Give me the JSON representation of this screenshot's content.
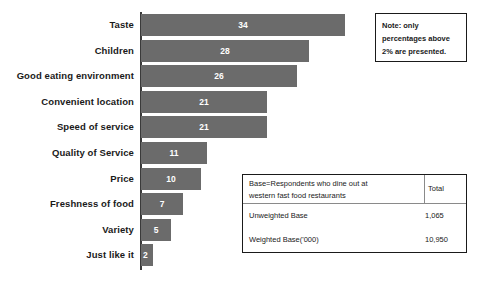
{
  "chart_data": {
    "type": "bar",
    "orientation": "horizontal",
    "title": "",
    "xlabel": "",
    "ylabel": "",
    "xlim": [
      0,
      34
    ],
    "grid": false,
    "legend": false,
    "bar_color": "#6b6b6b",
    "categories": [
      "Taste",
      "Children",
      "Good eating environment",
      "Convenient location",
      "Speed of service",
      "Quality of Service",
      "Price",
      "Freshness of food",
      "Variety",
      "Just like it"
    ],
    "values": [
      34,
      28,
      26,
      21,
      21,
      11,
      10,
      7,
      5,
      2
    ],
    "value_labels": [
      "34",
      "28",
      "26",
      "21",
      "21",
      "11",
      "10",
      "7",
      "5",
      "2"
    ]
  },
  "note_box": {
    "lines": [
      "Note: only",
      "percentages above",
      "2% are presented."
    ]
  },
  "base_table": {
    "header_label_line1": "Base=Respondents who dine out at",
    "header_label_line2": "western fast food restaurants",
    "header_total": "Total",
    "rows": [
      {
        "label": "Unweighted Base",
        "value": "1,065"
      },
      {
        "label": "Weighted Base('000)",
        "value": "10,950"
      }
    ]
  }
}
